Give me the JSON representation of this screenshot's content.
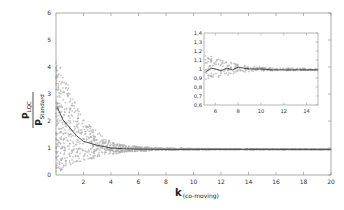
{
  "chart_data": [
    {
      "type": "scatter",
      "title": "",
      "xlabel": "k (co-moving)",
      "ylabel": "P_LQC / P_Standard",
      "xlim": [
        0,
        20
      ],
      "ylim": [
        0,
        6
      ],
      "x_ticks": [
        2,
        4,
        6,
        8,
        10,
        12,
        14,
        16,
        18,
        20
      ],
      "y_ticks": [
        0,
        1,
        2,
        3,
        4,
        5,
        6
      ],
      "grid": false,
      "series": [
        {
          "name": "scatter samples (envelope)",
          "style": "gray crosses",
          "x": [
            0.1,
            0.5,
            1,
            1.5,
            2,
            3,
            4,
            5,
            6,
            8,
            10,
            12,
            15,
            20
          ],
          "upper": [
            4.3,
            3.8,
            3.2,
            2.6,
            2.1,
            1.6,
            1.25,
            1.1,
            1.05,
            1.0,
            0.98,
            0.97,
            0.96,
            0.95
          ],
          "lower": [
            0.1,
            0.2,
            0.3,
            0.45,
            0.5,
            0.65,
            0.75,
            0.85,
            0.88,
            0.92,
            0.93,
            0.94,
            0.94,
            0.94
          ]
        },
        {
          "name": "mean",
          "style": "black line",
          "x": [
            0.1,
            0.5,
            1,
            1.5,
            2,
            3,
            4,
            5,
            6,
            8,
            10,
            15,
            20
          ],
          "values": [
            2.5,
            2.05,
            1.75,
            1.45,
            1.25,
            1.1,
            1.0,
            0.97,
            0.96,
            0.95,
            0.95,
            0.95,
            0.95
          ]
        }
      ]
    },
    {
      "type": "scatter",
      "title": "inset",
      "xlim": [
        5,
        15
      ],
      "ylim": [
        0.6,
        1.4
      ],
      "x_ticks": [
        6,
        8,
        10,
        12,
        14
      ],
      "y_ticks": [
        "0,6",
        "0,7",
        "0,8",
        "0,9",
        "1",
        "1,1",
        "1,2",
        "1,3",
        "1,4"
      ],
      "series": [
        {
          "name": "mean",
          "x": [
            5.2,
            5.6,
            6,
            6.5,
            7,
            7.5,
            8,
            8.5,
            9,
            10,
            11,
            12,
            13,
            14,
            15
          ],
          "values": [
            0.97,
            1.01,
            1.0,
            0.98,
            1.01,
            0.99,
            1.02,
            1.01,
            1.0,
            1.0,
            0.99,
            0.99,
            0.99,
            0.99,
            0.99
          ]
        },
        {
          "name": "upper envelope",
          "x": [
            5.2,
            6,
            7,
            8,
            9,
            10,
            12,
            15
          ],
          "values": [
            1.16,
            1.13,
            1.09,
            1.05,
            1.03,
            1.02,
            1.01,
            1.0
          ]
        },
        {
          "name": "lower envelope",
          "x": [
            5.2,
            6,
            7,
            8,
            9,
            10,
            12,
            15
          ],
          "values": [
            0.87,
            0.9,
            0.93,
            0.96,
            0.97,
            0.98,
            0.98,
            0.99
          ]
        }
      ]
    }
  ],
  "labels": {
    "x_axis_main": "k",
    "x_axis_sub": "(co-moving)",
    "y_num_main": "P",
    "y_num_sub": "LQC",
    "y_den_main": "P",
    "y_den_sub": "Standard"
  }
}
